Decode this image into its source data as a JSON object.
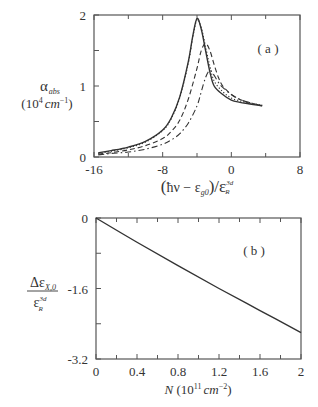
{
  "chart_data": [
    {
      "type": "line",
      "panel": "(a)",
      "ylabel": "α_abs (10^4 cm^-1)",
      "ylabel_main": "α",
      "ylabel_sub": "abs",
      "ylabel_units": "(10⁴ cm⁻¹)",
      "xlabel": "(ħν − ε_g0)/ε_R^3d",
      "xlim": [
        -16,
        8
      ],
      "ylim": [
        0,
        2
      ],
      "xticks": [
        "-16",
        "-8",
        "0",
        "8"
      ],
      "yticks": [
        "0",
        "1",
        "2"
      ],
      "grid": false,
      "legend": null,
      "series": [
        {
          "name": "solid",
          "style": "solid",
          "x": [
            -15.5,
            -14,
            -12,
            -10,
            -8,
            -7,
            -6,
            -5,
            -4.5,
            -4,
            -3.5,
            -3,
            -2.5,
            -2,
            -1,
            0,
            1,
            2,
            3,
            3.6
          ],
          "y": [
            0.06,
            0.09,
            0.14,
            0.22,
            0.38,
            0.55,
            0.85,
            1.35,
            1.7,
            1.95,
            1.8,
            1.5,
            1.2,
            1.0,
            0.88,
            0.8,
            0.77,
            0.75,
            0.73,
            0.72
          ]
        },
        {
          "name": "dotted",
          "style": "dotted",
          "x": [
            -15.5,
            -14,
            -12,
            -10,
            -8,
            -7,
            -6,
            -5,
            -4.5,
            -4,
            -3.5,
            -3,
            -2.5,
            -2,
            -1,
            0,
            1,
            2,
            3,
            3.6
          ],
          "y": [
            0.05,
            0.08,
            0.13,
            0.21,
            0.37,
            0.54,
            0.84,
            1.33,
            1.68,
            1.93,
            1.82,
            1.55,
            1.28,
            1.07,
            0.92,
            0.83,
            0.79,
            0.76,
            0.74,
            0.73
          ]
        },
        {
          "name": "dashed",
          "style": "dashed",
          "x": [
            -15.5,
            -14,
            -12,
            -10,
            -8,
            -7,
            -6,
            -5,
            -4,
            -3.5,
            -3,
            -2.5,
            -2,
            -1.5,
            -1,
            0,
            1,
            2,
            3,
            3.6
          ],
          "y": [
            0.04,
            0.06,
            0.1,
            0.16,
            0.26,
            0.36,
            0.52,
            0.82,
            1.25,
            1.5,
            1.6,
            1.5,
            1.3,
            1.12,
            1.0,
            0.88,
            0.81,
            0.77,
            0.74,
            0.73
          ]
        },
        {
          "name": "dash-dot",
          "style": "dashdot",
          "x": [
            -15.5,
            -14,
            -12,
            -10,
            -8,
            -7,
            -6,
            -5,
            -4,
            -3.5,
            -3,
            -2.5,
            -2,
            -1.5,
            -1,
            0,
            1,
            2,
            3,
            3.6
          ],
          "y": [
            0.03,
            0.05,
            0.07,
            0.11,
            0.18,
            0.24,
            0.33,
            0.48,
            0.72,
            0.92,
            1.12,
            1.22,
            1.15,
            1.05,
            0.98,
            0.88,
            0.81,
            0.77,
            0.74,
            0.72
          ]
        }
      ]
    },
    {
      "type": "line",
      "panel": "(b)",
      "ylabel": "Δε_X,0 / ε_R^3d",
      "xlabel": "N (10^11 cm^-2)",
      "xlabel_main": "N",
      "xlabel_units": "(10¹¹ cm⁻²)",
      "xlim": [
        0,
        2
      ],
      "ylim": [
        -3.2,
        0
      ],
      "xticks": [
        "0",
        "0.4",
        "0.8",
        "1.2",
        "1.6",
        "2"
      ],
      "yticks": [
        "0",
        "-1.6",
        "-3.2"
      ],
      "grid": false,
      "legend": null,
      "series": [
        {
          "name": "shift",
          "style": "solid",
          "x": [
            0,
            0.4,
            0.8,
            1.2,
            1.6,
            2.0
          ],
          "y": [
            0,
            -0.55,
            -1.08,
            -1.6,
            -2.1,
            -2.6
          ]
        }
      ]
    }
  ],
  "panel_a": {
    "label": "( a )",
    "x_ticks": [
      "-16",
      "-8",
      "0",
      "8"
    ],
    "y_ticks": [
      "0",
      "1",
      "2"
    ],
    "ylabel_main": "α",
    "ylabel_sub": "abs",
    "ylabel_units_open": "(10",
    "ylabel_units_exp": "4",
    "ylabel_units_cm": "cm",
    "ylabel_units_cm_exp": "−1",
    "ylabel_units_close": ")"
  },
  "panel_b": {
    "label": "( b )",
    "x_ticks": [
      "0",
      "0.4",
      "0.8",
      "1.2",
      "1.6",
      "2"
    ],
    "y_ticks": [
      "0",
      "-1.6",
      "-3.2"
    ],
    "ylabel_num": "Δε",
    "ylabel_num_sub": "X,0",
    "ylabel_den": "ε",
    "ylabel_den_sup": "3d",
    "ylabel_den_sub": "R",
    "xlabel_main": "N",
    "xlabel_units_open": " (10",
    "xlabel_units_exp": "11",
    "xlabel_units_cm": "cm",
    "xlabel_units_cm_exp": "−2",
    "xlabel_units_close": ")"
  },
  "xlabel_a": {
    "open": "(",
    "hnu": "ħν − ε",
    "sub": "g0",
    "close": ")/ε",
    "sup": "3d",
    "sub2": "R"
  },
  "colors": {
    "ink": "#333333",
    "frame": "#555555"
  }
}
